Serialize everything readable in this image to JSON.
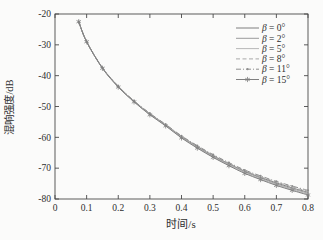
{
  "figure": {
    "background": "#fbfbfa",
    "frame_color": "#4a4a4a",
    "text_color": "#2e2e2e"
  },
  "chart_data": {
    "type": "line",
    "title": "",
    "xlabel": "时间/s",
    "ylabel": "混响强度/dB",
    "xlim": [
      0,
      0.8
    ],
    "ylim": [
      -80,
      -20
    ],
    "xticks": [
      0,
      0.1,
      0.2,
      0.3,
      0.4,
      0.5,
      0.6,
      0.7,
      0.8
    ],
    "xtick_labels": [
      "0",
      "0.1",
      "0.2",
      "0.3",
      "0.4",
      "0.5",
      "0.6",
      "0.7",
      "0.8"
    ],
    "yticks": [
      -20,
      -30,
      -40,
      -50,
      -60,
      -70,
      -80
    ],
    "ytick_labels": [
      "-20",
      "-30",
      "-40",
      "-50",
      "-60",
      "-70",
      "-80"
    ],
    "grid": false,
    "legend_position": "top-right",
    "x": [
      0.075,
      0.1,
      0.15,
      0.2,
      0.25,
      0.3,
      0.35,
      0.4,
      0.45,
      0.5,
      0.55,
      0.6,
      0.65,
      0.7,
      0.75,
      0.8
    ],
    "series": [
      {
        "name": "β = 0°",
        "line_style": "solid",
        "marker": "none",
        "color": "#7f7f7f",
        "values": [
          -22.5,
          -29.0,
          -37.5,
          -43.5,
          -48.3,
          -52.4,
          -56.0,
          -59.8,
          -63.0,
          -66.0,
          -68.6,
          -71.0,
          -73.0,
          -74.8,
          -76.4,
          -77.8
        ]
      },
      {
        "name": "β = 2°",
        "line_style": "solid",
        "marker": "none",
        "color": "#9c9c9c",
        "values": [
          -22.5,
          -29.0,
          -37.5,
          -43.6,
          -48.4,
          -52.5,
          -56.1,
          -59.9,
          -63.2,
          -66.2,
          -68.8,
          -71.2,
          -73.2,
          -75.1,
          -76.7,
          -78.1
        ]
      },
      {
        "name": "β = 5°",
        "line_style": "solid",
        "marker": "none",
        "color": "#b8b8b8",
        "values": [
          -22.5,
          -29.0,
          -37.6,
          -43.6,
          -48.4,
          -52.6,
          -56.2,
          -60.1,
          -63.3,
          -66.4,
          -69.0,
          -71.4,
          -73.5,
          -75.3,
          -77.0,
          -78.4
        ]
      },
      {
        "name": "β = 8°",
        "line_style": "dashed",
        "marker": "none",
        "color": "#a9a9a9",
        "values": [
          -22.5,
          -29.0,
          -37.5,
          -43.4,
          -48.2,
          -52.3,
          -55.9,
          -59.7,
          -62.8,
          -65.8,
          -68.4,
          -70.8,
          -72.8,
          -74.5,
          -76.1,
          -77.5
        ]
      },
      {
        "name": "β = 11°",
        "line_style": "dash-dot",
        "marker": "dot",
        "color": "#8e8e8e",
        "values": [
          -22.5,
          -29.0,
          -37.4,
          -43.4,
          -48.2,
          -52.2,
          -55.8,
          -59.5,
          -62.7,
          -65.6,
          -68.2,
          -70.6,
          -72.5,
          -74.3,
          -75.8,
          -77.2
        ]
      },
      {
        "name": "β = 15°",
        "line_style": "solid",
        "marker": "asterisk",
        "color": "#808080",
        "values": [
          -22.5,
          -29.0,
          -37.6,
          -43.7,
          -48.5,
          -52.7,
          -56.3,
          -60.2,
          -63.5,
          -66.5,
          -69.2,
          -71.7,
          -73.7,
          -75.6,
          -77.2,
          -78.7
        ]
      }
    ]
  }
}
